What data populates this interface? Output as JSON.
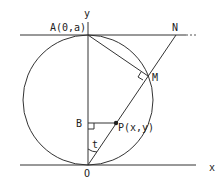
{
  "diagram": {
    "type": "geometry",
    "labels": {
      "y_axis": "y",
      "x_axis": "x",
      "A": "A(0,a)",
      "N": "N",
      "M": "M",
      "B": "B",
      "P": "P(x,y)",
      "angle": "t",
      "O": "O"
    },
    "points": {
      "O": [
        88,
        165
      ],
      "A": [
        88,
        35
      ],
      "N": [
        176,
        35
      ],
      "M": [
        148,
        76
      ],
      "B": [
        88,
        123
      ],
      "P": [
        116,
        123
      ],
      "circle_center": [
        88,
        100
      ],
      "circle_radius": 65
    },
    "colors": {
      "stroke": "#333333",
      "text": "#222222"
    }
  }
}
